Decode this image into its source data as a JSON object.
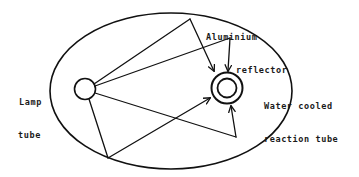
{
  "diagram": {
    "type": "optical-ray-diagram",
    "colors": {
      "line": "#111111",
      "background": "#ffffff",
      "text": "#1a1a1a"
    },
    "labels": {
      "lamp": [
        "Lamp",
        "tube"
      ],
      "reflector": [
        "Aluminium",
        "reflector"
      ],
      "reaction": [
        "Water cooled",
        "reaction tube"
      ]
    },
    "components": [
      {
        "id": "reflector",
        "shape": "ellipse",
        "name": "Aluminium reflector"
      },
      {
        "id": "lamp",
        "shape": "circle",
        "name": "Lamp tube"
      },
      {
        "id": "reaction-tube",
        "shape": "double-circle",
        "name": "Water cooled reaction tube"
      }
    ],
    "rays": [
      {
        "from": "lamp",
        "via": "reflector-top-left",
        "to": "reaction-tube",
        "arrow": true
      },
      {
        "from": "lamp",
        "via": "reflector-top-right",
        "to": "reaction-tube",
        "arrow": true
      },
      {
        "from": "lamp",
        "via": "reflector-bottom-right",
        "to": "reaction-tube",
        "arrow": true
      },
      {
        "from": "lamp",
        "via": "reflector-bottom-left",
        "to": "reaction-tube",
        "arrow": true
      }
    ]
  }
}
